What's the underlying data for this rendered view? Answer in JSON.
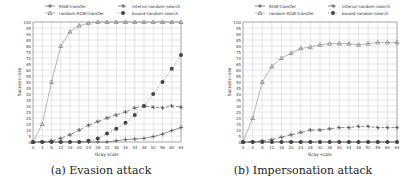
{
  "x_ticks": [
    0,
    4,
    8,
    12,
    16,
    20,
    24,
    28,
    32,
    36,
    40,
    44,
    48,
    52,
    56,
    60,
    64
  ],
  "y_ticks": [
    0,
    5,
    10,
    15,
    20,
    25,
    30,
    35,
    40,
    45,
    50,
    55,
    60,
    65,
    70,
    75,
    80,
    85,
    90,
    95,
    100
  ],
  "legend": [
    "RGB-transfer",
    "random-RGB-transfer",
    "interior-random-search",
    "bound-random-search"
  ],
  "panels": [
    {
      "caption": "(a) Evasion attack",
      "xlabel": "Gray scale",
      "ylabel": "Success rate"
    },
    {
      "caption": "(b) Impersonation attack",
      "xlabel": "Gray scale",
      "ylabel": "Success rate"
    }
  ],
  "chart_data": [
    {
      "type": "line",
      "title": "(a) Evasion attack",
      "xlabel": "Gray scale",
      "ylabel": "Success rate",
      "xlim": [
        0,
        64
      ],
      "ylim": [
        0,
        100
      ],
      "grid": true,
      "legend_position": "top",
      "x": [
        0,
        4,
        8,
        12,
        16,
        20,
        24,
        28,
        32,
        36,
        40,
        44,
        48,
        52,
        56,
        60,
        64
      ],
      "series": [
        {
          "name": "RGB-transfer",
          "marker": "plus",
          "values": [
            0,
            0,
            0,
            0,
            0,
            0,
            0,
            0,
            0,
            0,
            0,
            0,
            0,
            0,
            0,
            0,
            0
          ]
        },
        {
          "name": "random-RGB-transfer",
          "marker": "triangle",
          "values": [
            0,
            15,
            50,
            80,
            92,
            97,
            99,
            100,
            100,
            100,
            100,
            100,
            100,
            100,
            100,
            100,
            100
          ]
        },
        {
          "name": "interior-random-search",
          "marker": "star",
          "values": [
            0,
            0,
            1,
            3,
            6,
            10,
            14,
            17,
            20,
            22.5,
            25,
            28.5,
            30,
            29,
            28.5,
            30,
            29
          ]
        },
        {
          "name": "bound-random-search",
          "marker": "dot",
          "values": [
            0,
            0,
            0,
            0,
            0,
            0,
            1,
            2,
            2.5,
            2.5,
            3,
            4.5,
            6.5,
            9.5,
            12,
            0,
            0
          ]
        }
      ]
    },
    {
      "type": "line",
      "title": "(b) Impersonation attack",
      "xlabel": "Gray scale",
      "ylabel": "Success rate",
      "xlim": [
        0,
        64
      ],
      "ylim": [
        0,
        100
      ],
      "grid": true,
      "legend_position": "top",
      "x": [
        0,
        4,
        8,
        12,
        16,
        20,
        24,
        28,
        32,
        36,
        40,
        44,
        48,
        52,
        56,
        60,
        64
      ],
      "series": [
        {
          "name": "RGB-transfer",
          "marker": "plus",
          "values": [
            0,
            0,
            0,
            0,
            0,
            0,
            0,
            0,
            0,
            0,
            0,
            0,
            0,
            0,
            0,
            0,
            0
          ]
        },
        {
          "name": "random-RGB-transfer",
          "marker": "triangle",
          "values": [
            0,
            20,
            50,
            63,
            70,
            74,
            78,
            79,
            81,
            82,
            82,
            82,
            81,
            82,
            83,
            83,
            83
          ]
        },
        {
          "name": "interior-random-search",
          "marker": "star",
          "values": [
            0,
            0,
            1,
            2,
            4,
            6,
            8,
            10,
            10,
            11,
            12,
            12,
            13,
            13,
            12,
            12,
            12
          ]
        },
        {
          "name": "bound-random-search",
          "marker": "dot",
          "values": [
            0,
            0,
            0,
            0,
            0,
            0,
            0,
            0,
            0,
            0,
            0,
            0,
            0,
            0,
            0,
            0,
            0
          ]
        }
      ]
    }
  ],
  "evasion_bound_random_search": [
    0,
    0,
    0,
    0,
    0,
    0,
    1,
    3,
    7,
    11,
    16,
    22.5,
    30,
    40,
    50,
    61,
    72.5
  ],
  "evasion_low_series": [
    0,
    0,
    0,
    0,
    0,
    0,
    0,
    0,
    0,
    1,
    2,
    2.5,
    3,
    4.5,
    6.5,
    9.5,
    12
  ]
}
